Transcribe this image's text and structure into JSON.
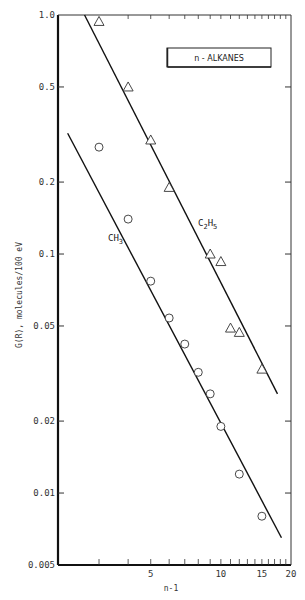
{
  "chart_data": {
    "type": "scatter",
    "title": "",
    "legend_box": "n - ALKANES",
    "xlabel": "n-1",
    "ylabel": "G(R), molecules/100 eV",
    "xscale": "log",
    "yscale": "log",
    "xlim": [
      2,
      20
    ],
    "ylim": [
      0.005,
      1.0
    ],
    "x_tick_labels": [
      {
        "value": 5,
        "label": "5"
      },
      {
        "value": 10,
        "label": "10"
      },
      {
        "value": 15,
        "label": "15"
      },
      {
        "value": 20,
        "label": "20"
      }
    ],
    "x_minor_ticks": [
      3,
      4,
      5,
      6,
      7,
      8,
      9,
      10,
      11,
      12,
      13,
      14,
      15,
      16,
      17,
      18,
      19
    ],
    "y_tick_labels": [
      {
        "value": 1.0,
        "label": "1.0"
      },
      {
        "value": 0.5,
        "label": "0.5"
      },
      {
        "value": 0.2,
        "label": "0.2"
      },
      {
        "value": 0.1,
        "label": "0.1"
      },
      {
        "value": 0.05,
        "label": "0.05"
      },
      {
        "value": 0.02,
        "label": "0.02"
      },
      {
        "value": 0.01,
        "label": "0.01"
      },
      {
        "value": 0.005,
        "label": "0.005"
      }
    ],
    "grid": false,
    "series": [
      {
        "name": "C2H5",
        "label_main": "C",
        "label_sub1": "2",
        "label_mid": "H",
        "label_sub2": "5",
        "marker": "triangle",
        "x": [
          3,
          4,
          5,
          6,
          9,
          10,
          11,
          12,
          15
        ],
        "y": [
          0.94,
          0.5,
          0.3,
          0.19,
          0.1,
          0.093,
          0.049,
          0.047,
          0.033
        ],
        "fit_line": {
          "x": [
            2.6,
            17.5
          ],
          "y": [
            1.0,
            0.026
          ]
        }
      },
      {
        "name": "CH3",
        "label_main": "CH",
        "label_sub": "3",
        "marker": "circle",
        "x": [
          3,
          4,
          5,
          6,
          7,
          8,
          9,
          10,
          12,
          15
        ],
        "y": [
          0.28,
          0.14,
          0.077,
          0.054,
          0.042,
          0.032,
          0.026,
          0.019,
          0.012,
          0.008
        ],
        "fit_line": {
          "x": [
            2.2,
            18.2
          ],
          "y": [
            0.32,
            0.0065
          ]
        }
      }
    ]
  }
}
